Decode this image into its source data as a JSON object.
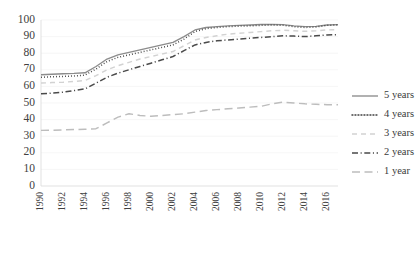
{
  "chart_data": {
    "type": "line",
    "title": "",
    "subtitle": "",
    "xlabel": "",
    "ylabel": "",
    "xlim": [
      1990,
      2017
    ],
    "ylim": [
      0,
      100
    ],
    "grid": true,
    "legend_position": "right",
    "x": [
      1990,
      1991,
      1992,
      1993,
      1994,
      1995,
      1996,
      1997,
      1998,
      1999,
      2000,
      2001,
      2002,
      2003,
      2004,
      2005,
      2006,
      2007,
      2008,
      2009,
      2010,
      2011,
      2012,
      2013,
      2014,
      2015,
      2016,
      2017
    ],
    "xtick_labels": [
      "1990",
      "1992",
      "1994",
      "1996",
      "1998",
      "2000",
      "2002",
      "2004",
      "2006",
      "2008",
      "2010",
      "2012",
      "2014",
      "2016"
    ],
    "ytick_labels": [
      "0",
      "10",
      "20",
      "30",
      "40",
      "50",
      "60",
      "70",
      "80",
      "90",
      "100"
    ],
    "ytick_values": [
      0,
      10,
      20,
      30,
      40,
      50,
      60,
      70,
      80,
      90,
      100
    ],
    "series": [
      {
        "name": "5 years",
        "style": "solid",
        "color": "#8c8c8c",
        "values": [
          67.0,
          67.3,
          67.6,
          67.8,
          68.2,
          72.0,
          76.5,
          79.0,
          80.5,
          82.0,
          83.5,
          85.0,
          86.5,
          90.0,
          94.0,
          95.5,
          96.0,
          96.5,
          96.8,
          97.0,
          97.3,
          97.4,
          97.2,
          96.5,
          96.0,
          96.2,
          97.0,
          97.2
        ]
      },
      {
        "name": "4 years",
        "style": "dotted",
        "color": "#404040",
        "values": [
          65.5,
          65.8,
          66.0,
          66.3,
          66.8,
          70.5,
          75.0,
          77.5,
          79.0,
          80.5,
          82.0,
          83.5,
          85.0,
          88.5,
          93.0,
          94.8,
          95.5,
          96.0,
          96.3,
          96.5,
          96.8,
          97.0,
          96.8,
          96.0,
          95.5,
          95.8,
          96.8,
          97.0
        ]
      },
      {
        "name": "3 years",
        "style": "light-dashed",
        "color": "#d2d2d2",
        "values": [
          62.0,
          62.3,
          62.5,
          63.0,
          63.5,
          66.5,
          70.0,
          72.5,
          74.5,
          76.5,
          78.0,
          79.5,
          81.0,
          84.5,
          88.0,
          89.5,
          90.5,
          91.5,
          92.0,
          92.5,
          93.0,
          93.5,
          93.8,
          93.5,
          93.2,
          93.5,
          94.0,
          94.2
        ]
      },
      {
        "name": "2 years",
        "style": "dash-dot",
        "color": "#4a4a4a",
        "values": [
          55.5,
          56.0,
          56.5,
          57.5,
          58.5,
          62.0,
          65.5,
          68.0,
          70.0,
          72.0,
          74.0,
          76.0,
          78.0,
          81.5,
          85.0,
          86.5,
          87.5,
          88.0,
          88.5,
          89.0,
          89.5,
          90.0,
          90.5,
          90.3,
          90.0,
          90.5,
          91.0,
          91.2
        ]
      },
      {
        "name": "1 year",
        "style": "long-dash",
        "color": "#bdbdbd",
        "values": [
          33.5,
          33.6,
          33.8,
          34.0,
          34.2,
          34.5,
          38.0,
          41.5,
          43.5,
          42.5,
          42.0,
          42.5,
          43.0,
          43.5,
          44.5,
          45.5,
          46.0,
          46.5,
          47.0,
          47.5,
          48.0,
          49.5,
          50.5,
          50.0,
          49.5,
          49.2,
          49.0,
          49.0
        ]
      }
    ]
  },
  "legend": {
    "entries": [
      {
        "label": "5 years",
        "style": "solid",
        "color": "#8c8c8c"
      },
      {
        "label": "4 years",
        "style": "dotted",
        "color": "#404040"
      },
      {
        "label": "3 years",
        "style": "light-dashed",
        "color": "#d2d2d2"
      },
      {
        "label": "2 years",
        "style": "dash-dot",
        "color": "#4a4a4a"
      },
      {
        "label": "1 year",
        "style": "long-dash",
        "color": "#bdbdbd"
      }
    ]
  },
  "colors": {
    "background": "#ffffff",
    "gridline": "#f0f0f0",
    "axis": "#d9d9d9",
    "text": "#3a3a3a"
  }
}
